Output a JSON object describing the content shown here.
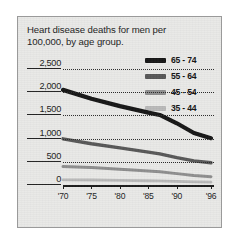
{
  "figure": {
    "title": "Heart disease deaths for men per 100,000, by age group."
  },
  "legend": {
    "position": "top-right",
    "items": [
      {
        "label": "65 - 74",
        "color": "#151515"
      },
      {
        "label": "55 - 64",
        "color": "#575757"
      },
      {
        "label": "45 - 54",
        "color": "#8e8e8e"
      },
      {
        "label": "35 - 44",
        "color": "#b9b9b9"
      }
    ]
  },
  "axes": {
    "y_ticks": [
      "0",
      "500",
      "1,000",
      "1,500",
      "2,000",
      "2,500"
    ],
    "x_ticks": [
      "'70",
      "'75",
      "'80",
      "'85",
      "'90",
      "'96"
    ]
  },
  "chart_data": {
    "type": "line",
    "title": "Heart disease deaths for men per 100,000, by age group.",
    "subtitle": "",
    "xlabel": "",
    "ylabel": "",
    "xlim": [
      1970,
      1996
    ],
    "ylim": [
      0,
      2500
    ],
    "grid": true,
    "legend_position": "top-right",
    "x": [
      1970,
      1975,
      1980,
      1985,
      1987,
      1990,
      1993,
      1996
    ],
    "x_tick_labels": [
      "'70",
      "'75",
      "'80",
      "'85",
      "'90",
      "'96"
    ],
    "x_tick_values": [
      1970,
      1975,
      1980,
      1985,
      1990,
      1996
    ],
    "y_tick_labels": [
      "0",
      "500",
      "1,000",
      "1,500",
      "2,000",
      "2,500"
    ],
    "y_tick_values": [
      0,
      500,
      1000,
      1500,
      2000,
      2500
    ],
    "series": [
      {
        "name": "65 - 74",
        "color": "#151515",
        "values": [
          2050,
          1860,
          1700,
          1560,
          1510,
          1330,
          1120,
          1010
        ]
      },
      {
        "name": "55 - 64",
        "color": "#575757",
        "values": [
          995,
          890,
          800,
          710,
          670,
          590,
          520,
          480
        ]
      },
      {
        "name": "45 - 54",
        "color": "#8e8e8e",
        "values": [
          400,
          375,
          340,
          300,
          285,
          245,
          205,
          180
        ]
      },
      {
        "name": "35 - 44",
        "color": "#b9b9b9",
        "values": [
          112,
          108,
          100,
          92,
          88,
          78,
          68,
          60
        ]
      }
    ]
  }
}
